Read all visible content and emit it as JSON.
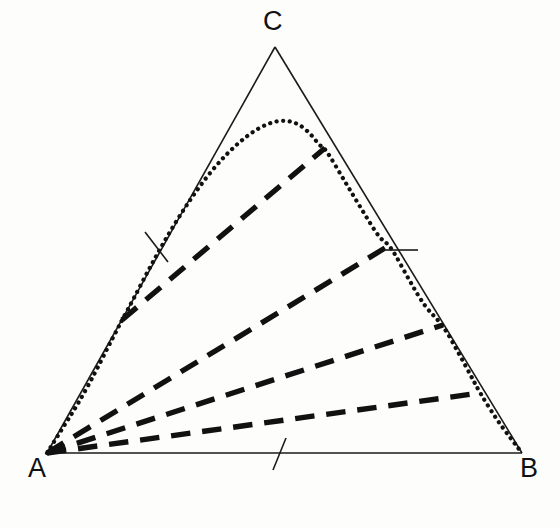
{
  "figure": {
    "kind": "ternary-phase-diagram",
    "background_color": "#fdfdfc",
    "width": 560,
    "height": 528
  },
  "vertices": {
    "A": {
      "label": "A",
      "x": 47,
      "y": 453
    },
    "B": {
      "label": "B",
      "x": 522,
      "y": 453
    },
    "C": {
      "label": "C",
      "x": 275,
      "y": 47
    }
  },
  "chart_data": {
    "type": "line",
    "title": "",
    "xlabel": "",
    "ylabel": "",
    "triangle_corners": [
      "A",
      "B",
      "C"
    ],
    "series": [
      {
        "name": "triangle-edge-AB",
        "style": "solid",
        "color": "#1a1a1a",
        "width": 1.6,
        "points": [
          [
            47,
            453
          ],
          [
            522,
            453
          ]
        ]
      },
      {
        "name": "triangle-edge-AC",
        "style": "solid",
        "color": "#1a1a1a",
        "width": 1.6,
        "points": [
          [
            47,
            453
          ],
          [
            275,
            47
          ]
        ]
      },
      {
        "name": "triangle-edge-CB",
        "style": "solid",
        "color": "#1a1a1a",
        "width": 1.6,
        "points": [
          [
            275,
            47
          ],
          [
            522,
            453
          ]
        ]
      },
      {
        "name": "binodal-dotted-curve",
        "style": "dotted",
        "color": "#111111",
        "width": 4.2,
        "points": [
          [
            47,
            453
          ],
          [
            62,
            429
          ],
          [
            78,
            404
          ],
          [
            95,
            373
          ],
          [
            108,
            347
          ],
          [
            117,
            330
          ],
          [
            122,
            320
          ],
          [
            133,
            300
          ],
          [
            149,
            269
          ],
          [
            165,
            240
          ],
          [
            182,
            212
          ],
          [
            199,
            187
          ],
          [
            218,
            163
          ],
          [
            238,
            143
          ],
          [
            258,
            128
          ],
          [
            278,
            120
          ],
          [
            296,
            122
          ],
          [
            310,
            133
          ],
          [
            320,
            146
          ],
          [
            325,
            148
          ],
          [
            344,
            180
          ],
          [
            362,
            210
          ],
          [
            380,
            239
          ],
          [
            390,
            245
          ],
          [
            408,
            278
          ],
          [
            425,
            307
          ],
          [
            443,
            325
          ],
          [
            458,
            352
          ],
          [
            470,
            374
          ],
          [
            480,
            393
          ],
          [
            497,
            420
          ],
          [
            512,
            440
          ],
          [
            522,
            453
          ]
        ]
      },
      {
        "name": "tie-line-1",
        "style": "dashed",
        "color": "#111111",
        "width": 5.4,
        "points": [
          [
            122,
            320
          ],
          [
            325,
            148
          ]
        ]
      },
      {
        "name": "tie-line-2",
        "style": "dashed",
        "color": "#111111",
        "width": 5.4,
        "points": [
          [
            47,
            453
          ],
          [
            390,
            245
          ]
        ]
      },
      {
        "name": "tie-line-3",
        "style": "dashed",
        "color": "#111111",
        "width": 5.4,
        "points": [
          [
            47,
            453
          ],
          [
            443,
            325
          ]
        ]
      },
      {
        "name": "tie-line-4",
        "style": "dashed",
        "color": "#111111",
        "width": 5.4,
        "points": [
          [
            47,
            453
          ],
          [
            480,
            393
          ]
        ]
      }
    ],
    "tick_marks": [
      {
        "name": "tick-edge-AC",
        "edge": "AC",
        "points": [
          [
            145,
            232
          ],
          [
            168,
            262
          ]
        ],
        "color": "#1a1a1a",
        "width": 1.6
      },
      {
        "name": "tick-edge-CB",
        "edge": "CB",
        "points": [
          [
            386,
            250
          ],
          [
            418,
            250
          ]
        ],
        "color": "#1a1a1a",
        "width": 1.6
      },
      {
        "name": "tick-edge-AB",
        "edge": "AB",
        "points": [
          [
            286,
            438
          ],
          [
            273,
            470
          ]
        ],
        "color": "#1a1a1a",
        "width": 1.6
      }
    ],
    "legend": [],
    "annotations": []
  }
}
